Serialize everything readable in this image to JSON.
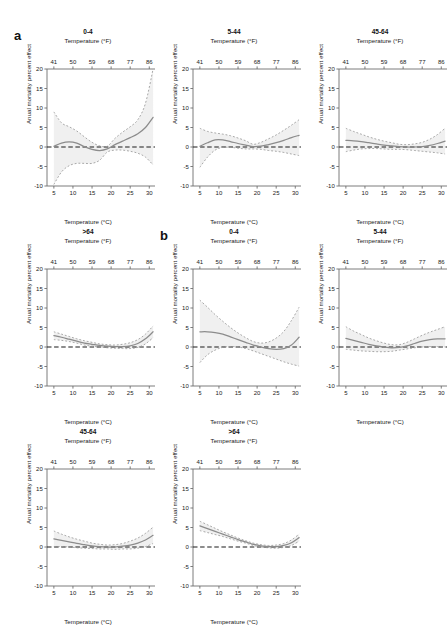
{
  "figure": {
    "width": 448,
    "height": 598,
    "background": "#ffffff",
    "groups": [
      {
        "letter": "a",
        "x": 14,
        "y": 28
      },
      {
        "letter": "b",
        "x": 160,
        "y": 228
      }
    ]
  },
  "axes": {
    "x_label_c": "Temperature (°C)",
    "x_label_f": "Temperature (°F)",
    "y_label": "Anual mortality percent effect",
    "x_ticks_c": [
      5,
      10,
      15,
      20,
      25,
      30
    ],
    "x_ticks_f": [
      41,
      50,
      59,
      68,
      77,
      86
    ],
    "y_ticks": [
      -10,
      -5,
      0,
      5,
      10,
      15,
      20
    ],
    "xlim": [
      3.2,
      31.5
    ],
    "ylim": [
      -10,
      20
    ],
    "reference_line_y": 0,
    "grid": false,
    "line_color": "#8c8c8c",
    "ci_color": "#9a9a9a",
    "band_color": "#ededed",
    "ref_color": "#1a1a1a",
    "axis_color": "#6e6e6e"
  },
  "chart_data": {
    "type": "line",
    "title": "",
    "xlabel": "Temperature (°C)",
    "ylabel": "Anual mortality percent effect",
    "xlim": [
      3.2,
      31.5
    ],
    "ylim": [
      -10,
      20
    ],
    "grid": false,
    "legend": "none",
    "x": [
      5,
      7,
      9,
      11,
      13,
      15,
      17,
      19,
      21,
      23,
      25,
      27,
      29,
      31
    ],
    "panels": [
      {
        "id": "a-0-4",
        "group": "a",
        "title": "0-4",
        "row": 0,
        "col": 0,
        "x_px": 14,
        "y_px": 28,
        "series": [
          {
            "name": "estimate",
            "style": "solid",
            "values": [
              0.2,
              1.0,
              1.3,
              1.0,
              0.1,
              -0.6,
              -0.9,
              -0.5,
              0.6,
              1.5,
              2.4,
              3.4,
              5.0,
              7.6
            ]
          },
          {
            "name": "upper_ci",
            "style": "dashed",
            "values": [
              9.0,
              6.2,
              5.2,
              4.1,
              2.6,
              1.2,
              0.3,
              0.2,
              2.2,
              3.8,
              5.2,
              7.0,
              11.2,
              20.0
            ]
          },
          {
            "name": "lower_ci",
            "style": "dashed",
            "values": [
              -9.6,
              -6.4,
              -4.8,
              -4.2,
              -4.2,
              -4.2,
              -3.4,
              -1.3,
              -0.8,
              -0.8,
              -1.1,
              -1.6,
              -2.6,
              -4.6
            ]
          }
        ]
      },
      {
        "id": "a-5-44",
        "group": "a",
        "title": "5-44",
        "row": 0,
        "col": 1,
        "x_px": 160,
        "y_px": 28,
        "series": [
          {
            "name": "estimate",
            "style": "solid",
            "values": [
              0.2,
              1.1,
              1.8,
              1.8,
              1.4,
              0.9,
              0.5,
              0.1,
              0.2,
              0.6,
              1.1,
              1.7,
              2.4,
              3.0
            ]
          },
          {
            "name": "upper_ci",
            "style": "dashed",
            "values": [
              4.8,
              4.0,
              3.6,
              3.3,
              2.9,
              2.3,
              1.6,
              0.7,
              1.2,
              2.1,
              3.1,
              4.3,
              5.6,
              7.0
            ]
          },
          {
            "name": "lower_ci",
            "style": "dashed",
            "values": [
              -5.2,
              -2.6,
              -0.8,
              -0.1,
              -0.1,
              -0.3,
              -0.5,
              -0.5,
              -0.6,
              -0.9,
              -1.1,
              -1.4,
              -1.8,
              -2.2
            ]
          }
        ]
      },
      {
        "id": "a-45-64",
        "group": "a",
        "title": "45-64",
        "row": 0,
        "col": 2,
        "x_px": 306,
        "y_px": 28,
        "series": [
          {
            "name": "estimate",
            "style": "solid",
            "values": [
              1.7,
              1.6,
              1.4,
              1.1,
              0.8,
              0.5,
              0.3,
              0.1,
              0.0,
              0.0,
              0.1,
              0.4,
              0.9,
              1.5
            ]
          },
          {
            "name": "upper_ci",
            "style": "dashed",
            "values": [
              4.8,
              4.0,
              3.3,
              2.6,
              2.0,
              1.5,
              1.1,
              0.7,
              0.6,
              0.8,
              1.2,
              2.0,
              3.2,
              4.8
            ]
          },
          {
            "name": "lower_ci",
            "style": "dashed",
            "values": [
              -1.2,
              -0.8,
              -0.5,
              -0.4,
              -0.4,
              -0.5,
              -0.6,
              -0.6,
              -0.7,
              -0.9,
              -1.1,
              -1.3,
              -1.5,
              -1.8
            ]
          }
        ]
      },
      {
        "id": "a-gt64",
        "group": "a",
        "title": ">64",
        "row": 1,
        "col": 0,
        "x_px": 14,
        "y_px": 228,
        "series": [
          {
            "name": "estimate",
            "style": "solid",
            "values": [
              2.9,
              2.5,
              2.0,
              1.5,
              1.0,
              0.7,
              0.4,
              0.2,
              0.1,
              0.1,
              0.3,
              0.9,
              2.1,
              3.9
            ]
          },
          {
            "name": "upper_ci",
            "style": "dashed",
            "values": [
              3.9,
              3.3,
              2.7,
              2.1,
              1.6,
              1.2,
              0.8,
              0.6,
              0.5,
              0.7,
              1.1,
              1.9,
              3.3,
              5.4
            ]
          },
          {
            "name": "lower_ci",
            "style": "dashed",
            "values": [
              1.9,
              1.7,
              1.4,
              1.0,
              0.5,
              0.2,
              0.0,
              -0.2,
              -0.3,
              -0.4,
              -0.4,
              -0.1,
              0.8,
              2.4
            ]
          }
        ]
      },
      {
        "id": "b-0-4",
        "group": "b",
        "title": "0-4",
        "row": 1,
        "col": 1,
        "x_px": 160,
        "y_px": 228,
        "series": [
          {
            "name": "estimate",
            "style": "solid",
            "values": [
              3.9,
              3.9,
              3.7,
              3.3,
              2.6,
              1.9,
              1.2,
              0.5,
              0.0,
              -0.4,
              -0.6,
              -0.4,
              0.5,
              2.5
            ]
          },
          {
            "name": "upper_ci",
            "style": "dashed",
            "values": [
              12.0,
              10.2,
              8.3,
              6.6,
              5.0,
              3.6,
              2.4,
              1.4,
              1.0,
              1.3,
              2.3,
              4.0,
              6.8,
              10.2
            ]
          },
          {
            "name": "lower_ci",
            "style": "dashed",
            "values": [
              -4.0,
              -2.0,
              -0.8,
              -0.1,
              0.1,
              0.0,
              -0.4,
              -1.0,
              -1.7,
              -2.4,
              -3.1,
              -3.8,
              -4.4,
              -4.9
            ]
          }
        ]
      },
      {
        "id": "b-5-44",
        "group": "b",
        "title": "5-44",
        "row": 1,
        "col": 2,
        "x_px": 306,
        "y_px": 228,
        "series": [
          {
            "name": "estimate",
            "style": "solid",
            "values": [
              2.2,
              1.7,
              1.2,
              0.7,
              0.3,
              0.0,
              -0.2,
              -0.1,
              0.3,
              0.9,
              1.5,
              1.9,
              2.1,
              2.1
            ]
          },
          {
            "name": "upper_ci",
            "style": "dashed",
            "values": [
              5.2,
              4.1,
              3.2,
              2.3,
              1.6,
              1.0,
              0.6,
              0.6,
              1.2,
              2.1,
              3.0,
              3.8,
              4.5,
              5.2
            ]
          },
          {
            "name": "lower_ci",
            "style": "dashed",
            "values": [
              -0.6,
              -0.8,
              -1.0,
              -1.1,
              -1.2,
              -1.2,
              -1.1,
              -0.8,
              -0.5,
              -0.2,
              0.0,
              0.1,
              0.1,
              0.0
            ]
          }
        ]
      },
      {
        "id": "b-45-64",
        "group": "b",
        "title": "45-64",
        "row": 2,
        "col": 0,
        "x_px": 14,
        "y_px": 428,
        "series": [
          {
            "name": "estimate",
            "style": "solid",
            "values": [
              2.1,
              1.7,
              1.3,
              0.9,
              0.6,
              0.3,
              0.1,
              0.0,
              0.0,
              0.2,
              0.5,
              1.0,
              1.8,
              3.0
            ]
          },
          {
            "name": "upper_ci",
            "style": "dashed",
            "values": [
              4.1,
              3.3,
              2.6,
              2.0,
              1.5,
              1.0,
              0.7,
              0.5,
              0.6,
              0.9,
              1.5,
              2.3,
              3.5,
              5.1
            ]
          },
          {
            "name": "lower_ci",
            "style": "dashed",
            "values": [
              0.1,
              0.1,
              0.0,
              -0.2,
              -0.3,
              -0.4,
              -0.5,
              -0.5,
              -0.6,
              -0.5,
              -0.5,
              -0.3,
              0.1,
              0.9
            ]
          }
        ]
      },
      {
        "id": "b-gt64",
        "group": "b",
        "title": ">64",
        "row": 2,
        "col": 1,
        "x_px": 160,
        "y_px": 428,
        "series": [
          {
            "name": "estimate",
            "style": "solid",
            "values": [
              5.4,
              4.7,
              4.0,
              3.3,
              2.6,
              1.9,
              1.3,
              0.7,
              0.3,
              0.1,
              0.1,
              0.4,
              1.1,
              2.4
            ]
          },
          {
            "name": "upper_ci",
            "style": "dashed",
            "values": [
              6.6,
              5.7,
              4.8,
              3.9,
              3.1,
              2.3,
              1.6,
              1.0,
              0.6,
              0.4,
              0.5,
              0.9,
              1.8,
              3.3
            ]
          },
          {
            "name": "lower_ci",
            "style": "dashed",
            "values": [
              4.2,
              3.7,
              3.2,
              2.7,
              2.1,
              1.5,
              1.0,
              0.4,
              0.0,
              -0.2,
              -0.3,
              -0.1,
              0.4,
              1.5
            ]
          }
        ]
      }
    ]
  }
}
